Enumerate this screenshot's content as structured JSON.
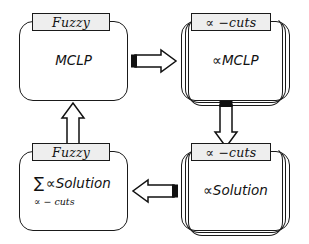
{
  "diagram": {
    "background_color": "#ffffff",
    "stroke_color": "#1a1a1a",
    "plate_fill_color": "#eeeeee"
  },
  "nodes": [
    {
      "id": "fuzzy-mclp",
      "plate_label": "Fuzzy",
      "body_text": "MCLP",
      "sub_text": "",
      "sigma": "",
      "stacked": false,
      "position": "top-left"
    },
    {
      "id": "alpha-mclp",
      "plate_label": "∝ −cuts",
      "body_text": "∝MCLP",
      "sub_text": "",
      "sigma": "",
      "stacked": true,
      "position": "top-right"
    },
    {
      "id": "fuzzy-solution",
      "plate_label": "Fuzzy",
      "body_text": "∝Solution",
      "sub_text": "∝ − cuts",
      "sigma": "∑",
      "stacked": false,
      "position": "bottom-left"
    },
    {
      "id": "alpha-solution",
      "plate_label": "∝ −cuts",
      "body_text": "∝Solution",
      "sub_text": "",
      "sigma": "",
      "stacked": true,
      "position": "bottom-right"
    }
  ],
  "arrows": [
    {
      "id": "arrow-top",
      "direction": "right",
      "from": "fuzzy-mclp",
      "to": "alpha-mclp"
    },
    {
      "id": "arrow-right",
      "direction": "down",
      "from": "alpha-mclp",
      "to": "alpha-solution"
    },
    {
      "id": "arrow-bottom",
      "direction": "left",
      "from": "alpha-solution",
      "to": "fuzzy-solution"
    },
    {
      "id": "arrow-left",
      "direction": "up",
      "from": "fuzzy-solution",
      "to": "fuzzy-mclp"
    }
  ]
}
